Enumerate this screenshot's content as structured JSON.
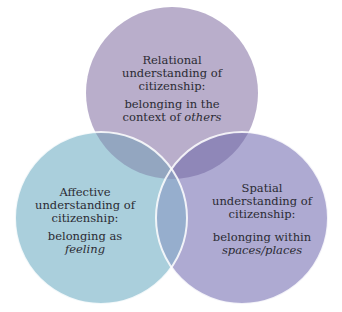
{
  "diagram": {
    "type": "venn",
    "circles": [
      {
        "id": "relational",
        "title_lines": [
          "Relational",
          "understanding of",
          "citizenship:"
        ],
        "sub_line1": "belonging in the",
        "sub_line2_prefix": "context of ",
        "sub_line2_italic": "others",
        "color": "#b9aecb"
      },
      {
        "id": "affective",
        "title_lines": [
          "Affective",
          "understanding of",
          "citizenship:"
        ],
        "sub_line1": "belonging as",
        "sub_line2_italic": "feeling",
        "color": "#aacfdc"
      },
      {
        "id": "spatial",
        "title_lines": [
          "Spatial",
          "understanding of",
          "citizenship:"
        ],
        "sub_line1": "belonging within",
        "sub_line2_italic": "spaces/places",
        "color": "#aeaad2"
      }
    ],
    "overlap_colors": {
      "top_left": "#93a6c0",
      "top_right": "#8f87b8",
      "left_right": "#96aecd",
      "center": "#8c9bbf"
    }
  }
}
